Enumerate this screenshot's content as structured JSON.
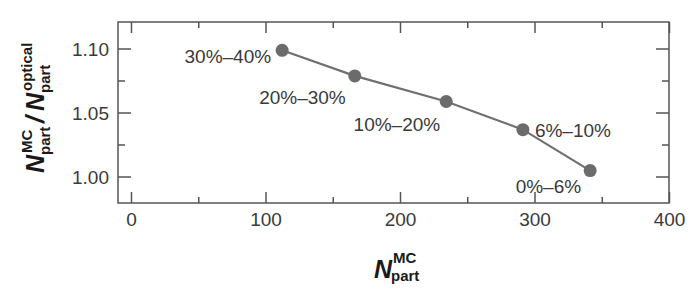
{
  "chart_data": {
    "type": "line",
    "title": "",
    "xlabel": {
      "main": "N",
      "sup": "MC",
      "sub": "part"
    },
    "ylabel": {
      "num_main": "N",
      "num_sup": "MC",
      "num_sub": "part",
      "sep": "/",
      "den_main": "N",
      "den_sup": "optical",
      "den_sub": "part"
    },
    "xlim": [
      0,
      400
    ],
    "ylim": [
      0.98,
      1.12
    ],
    "xticks": [
      0,
      100,
      200,
      300,
      400
    ],
    "xtick_labels": [
      "0",
      "100",
      "200",
      "300",
      "400"
    ],
    "xminor_ticks": [
      50,
      150,
      250,
      350
    ],
    "yticks": [
      1.0,
      1.05,
      1.1
    ],
    "ytick_labels": [
      "1.00",
      "1.05",
      "1.10"
    ],
    "yminor_ticks": [
      1.025,
      1.075
    ],
    "grid": false,
    "legend": null,
    "series": [
      {
        "name": "centrality",
        "color": "#6b6b6b",
        "marker": "circle",
        "x": [
          112,
          166,
          234,
          291,
          341
        ],
        "y": [
          1.099,
          1.079,
          1.059,
          1.037,
          1.005
        ],
        "point_labels": [
          "30%–40%",
          "20%–30%",
          "10%–20%",
          "6%–10%",
          "0%–6%"
        ]
      }
    ]
  },
  "colors": {
    "line": "#707070",
    "marker": "#6b6b6b",
    "axis": "#555555",
    "text": "#3a3a3a"
  }
}
